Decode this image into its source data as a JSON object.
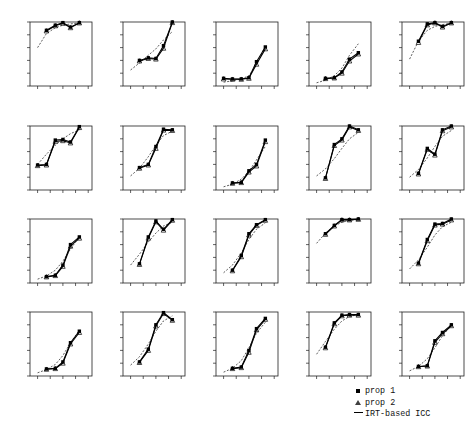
{
  "figure": {
    "axis": {
      "y_label": "p",
      "x_label": "theta",
      "y_ticks": [
        "0.0",
        "0.2",
        "0.4",
        "0.6",
        "0.8",
        "1.0"
      ],
      "x_ticks": [
        "-2",
        "-1",
        "0",
        "1",
        "2"
      ],
      "y_lim": [
        0.0,
        1.0
      ],
      "x_lim": [
        -2.6,
        2.3
      ]
    },
    "legend": {
      "items": [
        {
          "key": "filled-square-marker",
          "label": "prop 1"
        },
        {
          "key": "triangle-marker",
          "label": "prop 2"
        },
        {
          "key": "dashed-line",
          "label": "IRT-based ICC"
        }
      ]
    },
    "grid": {
      "rows": 4,
      "cols": 5
    }
  },
  "chart_data": {
    "type": "line",
    "title": "",
    "xlabel": "theta",
    "ylabel": "p",
    "xlim": [
      -2.6,
      2.3
    ],
    "ylim": [
      0.0,
      1.0
    ],
    "grid": false,
    "legend_position": "bottom-right",
    "legend": [
      "prop 1",
      "prop 2",
      "IRT-based ICC"
    ],
    "x": [
      -2.0,
      -1.3,
      -0.6,
      0.0,
      0.6,
      1.3
    ],
    "panels": [
      {
        "title": "item1",
        "series": [
          {
            "name": "prop 1",
            "values": [
              null,
              0.87,
              0.95,
              0.99,
              0.92,
              0.99
            ]
          },
          {
            "name": "prop 2",
            "values": [
              null,
              0.86,
              0.94,
              0.98,
              0.91,
              0.985
            ]
          },
          {
            "name": "IRT-based ICC",
            "values": [
              0.6,
              0.82,
              0.91,
              0.95,
              0.97,
              0.985
            ]
          }
        ]
      },
      {
        "title": "item7",
        "series": [
          {
            "name": "prop 1",
            "values": [
              null,
              0.4,
              0.44,
              0.43,
              0.63,
              1.0
            ]
          },
          {
            "name": "prop 2",
            "values": [
              null,
              0.39,
              0.43,
              0.42,
              0.59,
              0.99
            ]
          },
          {
            "name": "IRT-based ICC",
            "values": [
              0.25,
              0.36,
              0.48,
              0.58,
              0.72,
              0.85
            ]
          }
        ]
      },
      {
        "title": "item13",
        "series": [
          {
            "name": "prop 1",
            "values": [
              0.12,
              0.11,
              0.11,
              0.13,
              0.38,
              0.61
            ]
          },
          {
            "name": "prop 2",
            "values": [
              0.11,
              0.105,
              0.105,
              0.12,
              0.34,
              0.58
            ]
          },
          {
            "name": "IRT-based ICC",
            "values": [
              0.06,
              0.08,
              0.11,
              0.16,
              0.33,
              0.62
            ]
          }
        ]
      },
      {
        "title": "item14",
        "series": [
          {
            "name": "prop 1",
            "values": [
              null,
              0.12,
              0.13,
              0.22,
              0.42,
              0.52
            ]
          },
          {
            "name": "prop 2",
            "values": [
              null,
              0.115,
              0.125,
              0.2,
              0.39,
              0.5
            ]
          },
          {
            "name": "IRT-based ICC",
            "values": [
              0.05,
              0.09,
              0.16,
              0.28,
              0.48,
              0.66
            ]
          }
        ]
      },
      {
        "title": "item22",
        "series": [
          {
            "name": "prop 1",
            "values": [
              null,
              0.7,
              0.97,
              0.99,
              0.93,
              0.99
            ]
          },
          {
            "name": "prop 2",
            "values": [
              null,
              0.68,
              0.955,
              0.985,
              0.92,
              0.985
            ]
          },
          {
            "name": "IRT-based ICC",
            "values": [
              0.42,
              0.7,
              0.87,
              0.93,
              0.96,
              0.98
            ]
          }
        ]
      },
      {
        "title": "item36",
        "series": [
          {
            "name": "prop 1",
            "values": [
              0.39,
              0.4,
              0.78,
              0.79,
              0.75,
              0.99
            ]
          },
          {
            "name": "prop 2",
            "values": [
              0.38,
              0.39,
              0.76,
              0.77,
              0.735,
              0.975
            ]
          },
          {
            "name": "IRT-based ICC",
            "values": [
              0.4,
              0.56,
              0.7,
              0.8,
              0.88,
              0.94
            ]
          }
        ]
      },
      {
        "title": "item37",
        "series": [
          {
            "name": "prop 1",
            "values": [
              null,
              0.35,
              0.4,
              0.68,
              0.95,
              0.94
            ]
          },
          {
            "name": "prop 2",
            "values": [
              null,
              0.34,
              0.39,
              0.65,
              0.935,
              0.93
            ]
          },
          {
            "name": "IRT-based ICC",
            "values": [
              0.22,
              0.34,
              0.52,
              0.7,
              0.85,
              0.92
            ]
          }
        ]
      },
      {
        "title": "item40",
        "series": [
          {
            "name": "prop 1",
            "values": [
              null,
              0.11,
              0.12,
              0.3,
              0.4,
              0.78
            ]
          },
          {
            "name": "prop 2",
            "values": [
              null,
              0.105,
              0.115,
              0.28,
              0.375,
              0.755
            ]
          },
          {
            "name": "IRT-based ICC",
            "values": [
              0.05,
              0.09,
              0.17,
              0.29,
              0.47,
              0.68
            ]
          }
        ]
      },
      {
        "title": "item45",
        "series": [
          {
            "name": "prop 1",
            "values": [
              null,
              0.19,
              0.71,
              0.8,
              1.0,
              0.94
            ]
          },
          {
            "name": "prop 2",
            "values": [
              null,
              0.18,
              0.695,
              0.78,
              0.985,
              0.93
            ]
          },
          {
            "name": "IRT-based ICC",
            "values": [
              0.22,
              0.33,
              0.49,
              0.65,
              0.8,
              0.9
            ]
          }
        ]
      },
      {
        "title": "item46",
        "series": [
          {
            "name": "prop 1",
            "values": [
              null,
              0.26,
              0.65,
              0.56,
              0.94,
              1.0
            ]
          },
          {
            "name": "prop 2",
            "values": [
              null,
              0.25,
              0.635,
              0.545,
              0.925,
              0.985
            ]
          },
          {
            "name": "IRT-based ICC",
            "values": [
              0.2,
              0.32,
              0.5,
              0.68,
              0.84,
              0.93
            ]
          }
        ]
      },
      {
        "title": "item47",
        "series": [
          {
            "name": "prop 1",
            "values": [
              null,
              0.1,
              0.12,
              0.28,
              0.6,
              0.72
            ]
          },
          {
            "name": "prop 2",
            "values": [
              null,
              0.095,
              0.115,
              0.26,
              0.575,
              0.7
            ]
          },
          {
            "name": "IRT-based ICC",
            "values": [
              0.06,
              0.11,
              0.2,
              0.34,
              0.53,
              0.72
            ]
          }
        ]
      },
      {
        "title": "item55",
        "series": [
          {
            "name": "prop 1",
            "values": [
              null,
              0.3,
              0.72,
              0.97,
              0.84,
              0.99
            ]
          },
          {
            "name": "prop 2",
            "values": [
              null,
              0.29,
              0.7,
              0.955,
              0.825,
              0.98
            ]
          },
          {
            "name": "IRT-based ICC",
            "values": [
              0.28,
              0.45,
              0.64,
              0.78,
              0.89,
              0.95
            ]
          }
        ]
      },
      {
        "title": "item57",
        "series": [
          {
            "name": "prop 1",
            "values": [
              null,
              0.2,
              0.43,
              0.77,
              0.91,
              0.99
            ]
          },
          {
            "name": "prop 2",
            "values": [
              null,
              0.19,
              0.41,
              0.75,
              0.9,
              0.98
            ]
          },
          {
            "name": "IRT-based ICC",
            "values": [
              0.16,
              0.28,
              0.47,
              0.68,
              0.84,
              0.94
            ]
          }
        ]
      },
      {
        "title": "item61",
        "series": [
          {
            "name": "prop 1",
            "values": [
              null,
              0.77,
              0.9,
              0.99,
              0.99,
              1.0
            ]
          },
          {
            "name": "prop 2",
            "values": [
              null,
              0.76,
              0.89,
              0.985,
              0.985,
              0.995
            ]
          },
          {
            "name": "IRT-based ICC",
            "values": [
              0.62,
              0.78,
              0.89,
              0.95,
              0.98,
              0.99
            ]
          }
        ]
      },
      {
        "title": "item65",
        "series": [
          {
            "name": "prop 1",
            "values": [
              null,
              0.31,
              0.68,
              0.92,
              0.93,
              1.0
            ]
          },
          {
            "name": "prop 2",
            "values": [
              null,
              0.3,
              0.66,
              0.905,
              0.92,
              0.985
            ]
          },
          {
            "name": "IRT-based ICC",
            "values": [
              0.22,
              0.36,
              0.56,
              0.75,
              0.88,
              0.95
            ]
          }
        ]
      },
      {
        "title": "item67",
        "series": [
          {
            "name": "prop 1",
            "values": [
              null,
              0.11,
              0.12,
              0.22,
              0.52,
              0.7
            ]
          },
          {
            "name": "prop 2",
            "values": [
              null,
              0.105,
              0.115,
              0.2,
              0.5,
              0.68
            ]
          },
          {
            "name": "IRT-based ICC",
            "values": [
              0.05,
              0.1,
              0.18,
              0.32,
              0.52,
              0.72
            ]
          }
        ]
      },
      {
        "title": "item69",
        "series": [
          {
            "name": "prop 1",
            "values": [
              null,
              0.22,
              0.42,
              0.8,
              0.99,
              0.88
            ]
          },
          {
            "name": "prop 2",
            "values": [
              null,
              0.21,
              0.4,
              0.78,
              0.975,
              0.87
            ]
          },
          {
            "name": "IRT-based ICC",
            "values": [
              0.17,
              0.3,
              0.5,
              0.7,
              0.86,
              0.94
            ]
          }
        ]
      },
      {
        "title": "item73",
        "series": [
          {
            "name": "prop 1",
            "values": [
              null,
              0.12,
              0.14,
              0.4,
              0.74,
              0.9
            ]
          },
          {
            "name": "prop 2",
            "values": [
              null,
              0.115,
              0.13,
              0.37,
              0.72,
              0.885
            ]
          },
          {
            "name": "IRT-based ICC",
            "values": [
              0.06,
              0.12,
              0.24,
              0.44,
              0.67,
              0.84
            ]
          }
        ]
      },
      {
        "title": "item81",
        "series": [
          {
            "name": "prop 1",
            "values": [
              null,
              0.45,
              0.83,
              0.95,
              0.96,
              0.96
            ]
          },
          {
            "name": "prop 2",
            "values": [
              null,
              0.44,
              0.815,
              0.94,
              0.95,
              0.95
            ]
          },
          {
            "name": "IRT-based ICC",
            "values": [
              0.34,
              0.54,
              0.73,
              0.86,
              0.93,
              0.96
            ]
          }
        ]
      },
      {
        "title": "item93",
        "series": [
          {
            "name": "prop 1",
            "values": [
              null,
              0.15,
              0.16,
              0.55,
              0.68,
              0.8
            ]
          },
          {
            "name": "prop 2",
            "values": [
              null,
              0.145,
              0.155,
              0.525,
              0.66,
              0.785
            ]
          },
          {
            "name": "IRT-based ICC",
            "values": [
              0.08,
              0.15,
              0.27,
              0.44,
              0.63,
              0.79
            ]
          }
        ]
      }
    ]
  }
}
